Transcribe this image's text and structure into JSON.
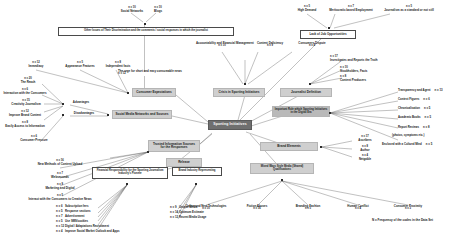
{
  "diagram": {
    "caption": "N = Frequency of the codes in the Data Set",
    "root": {
      "label": "Sporting  Initiatives"
    },
    "top": {
      "source_a": {
        "label": "Social Networks",
        "n": "n = 10"
      },
      "source_b": {
        "label": "Blogs",
        "n": "n = 10"
      },
      "statement": {
        "label": "Other Issues of Their Discrimination and the comments / social responses in which the journalist"
      },
      "branch_label": {
        "label": "The urge for short and easy consumable news",
        "n": "n = 12"
      }
    },
    "themes": {
      "consumer": {
        "label": "Consumer Expectations"
      },
      "social_media": {
        "label": "Social Media Networks and Sources"
      },
      "trusted": {
        "label": "Trusted Information Sources for the Responses"
      },
      "crisis": {
        "label": "Crisis in Sporting Initiatives"
      },
      "journalist": {
        "label": "Journalist Definition"
      },
      "important": {
        "label": "Important Role which Sporting Initiatives in the Digital Era"
      },
      "brand": {
        "label": "Brand Elements"
      },
      "mixed": {
        "label": "Mixed Ways Style Media (Shared) Qualifications"
      },
      "advantages": {
        "label": "Advantages"
      },
      "disadvantages": {
        "label": "Disadvantages"
      },
      "release": {
        "label": "Release"
      },
      "lack_jobs": {
        "label": "Lack of Job Opportunities"
      }
    },
    "outline_boxes": {
      "financial": {
        "label": "Financial Responsibility for the Sporting Journalism Industry's Pioneer"
      },
      "brand_industry": {
        "label": "Brand Industry Representing"
      }
    },
    "groups": {
      "lack_jobs_inputs": [
        {
          "label": "High Demand",
          "n": "n = 5"
        },
        {
          "label": "Meritocratic based Employment",
          "n": "n = 7"
        },
        {
          "label": "Journalism as a standard or not still",
          "n": "n = 5"
        }
      ],
      "consumer_inputs": [
        {
          "label": "Immediacy",
          "n": "n = 12"
        },
        {
          "label": "Appearance Features",
          "n": "n = 5"
        },
        {
          "label": "Independent facts",
          "n": "n = 8"
        }
      ],
      "advantages_inputs": [
        {
          "label": "The Reach",
          "n": "n = 20"
        },
        {
          "label": "Interaction with the Consumers",
          "n": "n = 6"
        },
        {
          "label": "Creativity Journalism",
          "n": "n = 15"
        },
        {
          "label": "Improve Brand Content",
          "n": "n = 12"
        },
        {
          "label": "Easily Access to Information",
          "n": "n = 8"
        }
      ],
      "disadvantages_inputs": [
        {
          "label": "Consumer Pressure",
          "n": "n = 6"
        }
      ],
      "journalist_inputs": [
        {
          "label": "Investigates and Reports the Truth",
          "n": "n = 17"
        },
        {
          "label": "Stockholders, Facts",
          "n": "n = 10"
        },
        {
          "label": "Content Producers",
          "n": "n = 8"
        }
      ],
      "crisis_inputs": [
        {
          "label": "Accountability and Financial Management",
          "n": "n = 10"
        },
        {
          "label": "Content Deficiency",
          "n": "n = 9"
        },
        {
          "label": "Consumers Dispute",
          "n": "n = 4"
        }
      ],
      "important_outputs": [
        {
          "label": "Transparency and Agent",
          "n": "n = 13"
        },
        {
          "label": "Context Figures",
          "n": "n = 6"
        },
        {
          "label": "Chronicalisation",
          "n": "n = 5"
        },
        {
          "label": "Academic Books",
          "n": "n = 5"
        },
        {
          "label": "Report Reviews",
          "n": "n = 8"
        },
        {
          "label": "(photos, symptoms etc.)",
          "n": ""
        },
        {
          "label": "Enclosed with a Cultural Mind",
          "n": "n = 5"
        }
      ],
      "brand_outputs": [
        {
          "label": "Ascribers",
          "n": "n = 17"
        },
        {
          "label": "Author",
          "n": "n = 8"
        },
        {
          "label": "Netgable",
          "n": "n = 4"
        }
      ],
      "trusted_inputs": [
        {
          "label": "New Methods of Content Upload",
          "n": "n = 16"
        },
        {
          "label": "Webseconds",
          "n": "n = 7"
        },
        {
          "label": "Marketing and Digital",
          "n": "n = 9"
        },
        {
          "label": "Interact with the Consumers to Creative News",
          "n": "n = 5"
        }
      ],
      "financial_outputs": [
        {
          "label": "Subscription fees",
          "n": "n = 6"
        },
        {
          "label": "Response sections",
          "n": "n = 5"
        },
        {
          "label": "Advertisement",
          "n": "n = 7"
        },
        {
          "label": "Use SMS/cookies",
          "n": "n = 5"
        },
        {
          "label": "Digital / Adaptations Recruitment",
          "n": "n = 12"
        },
        {
          "label": "Improve Social Market Outlook and Apps",
          "n": "n = 4"
        }
      ],
      "brand_industry_outputs": [
        {
          "label": "Unique Media",
          "n": "n = 9"
        },
        {
          "label": "Optimum Estimate",
          "n": "n = 14"
        },
        {
          "label": "Recent Media Usage",
          "n": "n = 12"
        }
      ],
      "mixed_outputs": [
        {
          "label": "Online and New Technologies",
          "n": "n = 10"
        },
        {
          "label": "Fiction Abuses",
          "n": "n = 16"
        },
        {
          "label": "Branding Fashion",
          "n": "n = 5"
        },
        {
          "label": "Human Conflict",
          "n": "n = 4"
        },
        {
          "label": "Consumer Proximity",
          "n": "n = 3"
        }
      ]
    }
  }
}
